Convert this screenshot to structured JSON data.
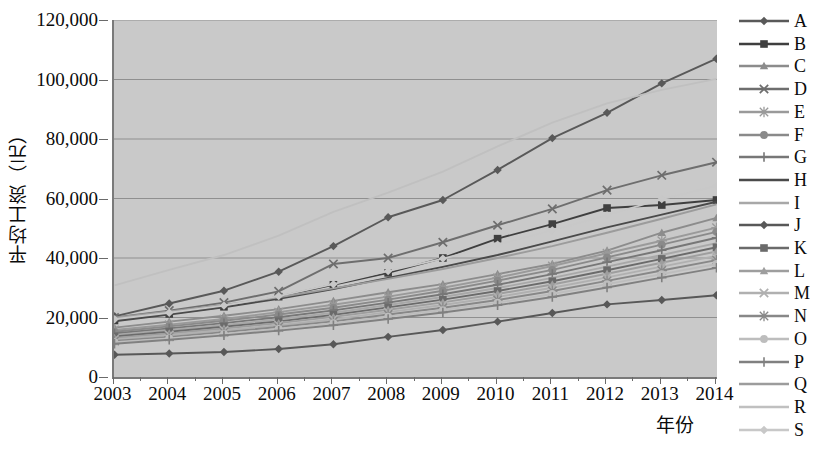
{
  "chart_data": {
    "type": "line",
    "title": "",
    "xlabel": "年份",
    "ylabel": "平均工资（元）",
    "ylim": [
      0,
      120000
    ],
    "ytick_labels": [
      "0",
      "20,000",
      "40,000",
      "60,000",
      "80,000",
      "100,000",
      "120,000"
    ],
    "yticks": [
      0,
      20000,
      40000,
      60000,
      80000,
      100000,
      120000
    ],
    "grid": true,
    "legend_position": "right",
    "categories": [
      "2003",
      "2004",
      "2005",
      "2006",
      "2007",
      "2008",
      "2009",
      "2010",
      "2011",
      "2012",
      "2013",
      "2014"
    ],
    "x": [
      2003,
      2004,
      2005,
      2006,
      2007,
      2008,
      2009,
      2010,
      2011,
      2012,
      2013,
      2014
    ],
    "series": [
      {
        "name": "A",
        "marker": "diamond",
        "color": "#595959",
        "values": [
          20400,
          24700,
          29000,
          35400,
          44000,
          53700,
          59500,
          69600,
          80300,
          88800,
          98700,
          107000
        ]
      },
      {
        "name": "B",
        "marker": "square",
        "color": "#3f3f3f",
        "values": [
          19000,
          21200,
          23600,
          27000,
          31000,
          35000,
          40000,
          46500,
          51400,
          56800,
          57800,
          59500
        ]
      },
      {
        "name": "C",
        "marker": "triangle",
        "color": "#8c8c8c",
        "values": [
          16600,
          18600,
          20600,
          22800,
          25600,
          28500,
          31200,
          34600,
          38000,
          42500,
          48500,
          53500
        ]
      },
      {
        "name": "D",
        "marker": "x",
        "color": "#6e6e6e",
        "values": [
          20000,
          22300,
          25000,
          28800,
          38000,
          40000,
          45300,
          51000,
          56500,
          62800,
          67800,
          72200
        ]
      },
      {
        "name": "E",
        "marker": "star",
        "color": "#9a9a9a",
        "values": [
          15800,
          17600,
          19500,
          21800,
          24300,
          27000,
          30000,
          33400,
          37300,
          41600,
          45800,
          50200
        ]
      },
      {
        "name": "F",
        "marker": "circle",
        "color": "#8a8a8a",
        "values": [
          15200,
          17000,
          18900,
          21000,
          23300,
          26000,
          29000,
          32400,
          36000,
          40200,
          44500,
          48800
        ]
      },
      {
        "name": "G",
        "marker": "plus",
        "color": "#777777",
        "values": [
          14600,
          16300,
          18100,
          20100,
          22400,
          25000,
          27800,
          31000,
          34600,
          38600,
          42600,
          46800
        ]
      },
      {
        "name": "H",
        "marker": "none",
        "color": "#4a4a4a",
        "values": [
          18700,
          21000,
          23400,
          26300,
          29600,
          33300,
          37000,
          41000,
          45600,
          50300,
          54600,
          58900
        ]
      },
      {
        "name": "I",
        "marker": "none",
        "color": "#a8a8a8",
        "values": [
          14100,
          15800,
          17500,
          19400,
          21600,
          24200,
          26900,
          29900,
          33300,
          37100,
          41000,
          45000
        ]
      },
      {
        "name": "J",
        "marker": "diamond",
        "color": "#585858",
        "values": [
          7500,
          7900,
          8400,
          9400,
          11000,
          13500,
          15800,
          18600,
          21500,
          24400,
          25900,
          27500
        ]
      },
      {
        "name": "K",
        "marker": "square",
        "color": "#6b6b6b",
        "values": [
          13600,
          15200,
          16900,
          18700,
          20900,
          23400,
          26000,
          28900,
          32200,
          35900,
          39700,
          43600
        ]
      },
      {
        "name": "L",
        "marker": "triangle",
        "color": "#9e9e9e",
        "values": [
          13100,
          14600,
          16300,
          18100,
          20200,
          22600,
          25100,
          27900,
          31100,
          34700,
          38400,
          42200
        ]
      },
      {
        "name": "M",
        "marker": "x",
        "color": "#b0b0b0",
        "values": [
          12600,
          14100,
          15700,
          17400,
          19400,
          21800,
          24200,
          26900,
          30000,
          33500,
          37100,
          40700
        ]
      },
      {
        "name": "N",
        "marker": "star",
        "color": "#888888",
        "values": [
          12100,
          13500,
          15100,
          16800,
          18700,
          21000,
          23300,
          25900,
          28900,
          32300,
          35800,
          39300
        ]
      },
      {
        "name": "O",
        "marker": "circle",
        "color": "#bdbdbd",
        "values": [
          11700,
          13000,
          14500,
          16200,
          18100,
          20300,
          22500,
          25000,
          27900,
          31200,
          34600,
          38000
        ]
      },
      {
        "name": "P",
        "marker": "plus",
        "color": "#808080",
        "values": [
          11200,
          12500,
          14000,
          15600,
          17400,
          19500,
          21700,
          24100,
          26900,
          30100,
          33400,
          36700
        ]
      },
      {
        "name": "Q",
        "marker": "none",
        "color": "#9c9c9c",
        "values": [
          19900,
          22000,
          24200,
          26800,
          29800,
          33000,
          36300,
          40000,
          44000,
          48500,
          53200,
          58000
        ]
      },
      {
        "name": "R",
        "marker": "none",
        "color": "#c0c0c0",
        "values": [
          30800,
          36000,
          41000,
          47500,
          55500,
          62000,
          69000,
          77500,
          85500,
          92000,
          96500,
          100200
        ]
      },
      {
        "name": "S",
        "marker": "diamond",
        "color": "#c8c8c8",
        "values": [
          19400,
          21600,
          24000,
          27200,
          31200,
          35600,
          39800,
          44500,
          49300,
          54400,
          59800,
          64200
        ]
      }
    ]
  },
  "axis": {
    "y_title": "平均工资（元）",
    "x_title": "年份",
    "y_tick_labels": [
      "120,000",
      "100,000",
      "80,000",
      "60,000",
      "40,000",
      "20,000",
      "0"
    ],
    "x_tick_labels": [
      "2003",
      "2004",
      "2005",
      "2006",
      "2007",
      "2008",
      "2009",
      "2010",
      "2011",
      "2012",
      "2013",
      "2014"
    ]
  },
  "legend": {
    "items": [
      {
        "label": "A"
      },
      {
        "label": "B"
      },
      {
        "label": "C"
      },
      {
        "label": "D"
      },
      {
        "label": "E"
      },
      {
        "label": "F"
      },
      {
        "label": "G"
      },
      {
        "label": "H"
      },
      {
        "label": "I"
      },
      {
        "label": "J"
      },
      {
        "label": "K"
      },
      {
        "label": "L"
      },
      {
        "label": "M"
      },
      {
        "label": "N"
      },
      {
        "label": "O"
      },
      {
        "label": "P"
      },
      {
        "label": "Q"
      },
      {
        "label": "R"
      },
      {
        "label": "S"
      }
    ]
  },
  "colors": {
    "plot_background": "#c9c9c9",
    "page_background": "#ffffff",
    "axis": "#7a7a7a",
    "grid": "#8f8f8f",
    "text": "#0b0b0b"
  }
}
